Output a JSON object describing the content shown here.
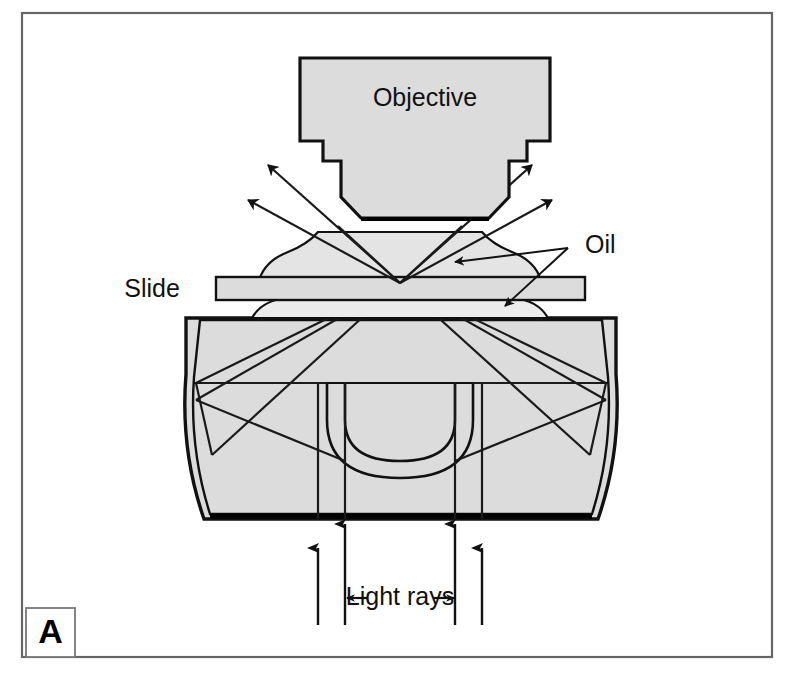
{
  "figure": {
    "panel_letter": "A",
    "title_caption": "",
    "background_color": "#ffffff",
    "frame_color": "#555555",
    "part_fill_color": "#dcdcdc",
    "outline_color": "#000000",
    "ray_color": "#1a1a1a"
  },
  "labels": {
    "objective": "Objective",
    "slide": "Slide",
    "oil": "Oil",
    "light_rays": "Light rays"
  },
  "components": [
    {
      "name": "objective",
      "label": "Objective",
      "description": "stepped objective lens housing at top of diagram"
    },
    {
      "name": "oil-drop-upper",
      "label": "Oil",
      "description": "wavy oil droplet between objective front lens and slide"
    },
    {
      "name": "slide",
      "label": "Slide",
      "description": "thin horizontal glass microscope slide"
    },
    {
      "name": "oil-drop-lower",
      "label": "Oil",
      "description": "wavy oil layer between slide and condenser top"
    },
    {
      "name": "condenser",
      "label": "",
      "description": "octagonal condenser body with semicircular internal lens"
    }
  ],
  "rays": {
    "light_rays_label": "Light rays",
    "incoming_ray_count": 4,
    "escaping_ray_count": 4,
    "focal_point_description": "all rays converge at a single point on the top surface of the slide"
  },
  "annotations": [
    {
      "name": "oil-leader-upper",
      "target": "oil-drop-upper"
    },
    {
      "name": "oil-leader-lower",
      "target": "oil-drop-lower"
    },
    {
      "name": "light-rays-left-arrow",
      "target": "light-rays-span-left"
    },
    {
      "name": "light-rays-right-arrow",
      "target": "light-rays-span-right"
    }
  ]
}
